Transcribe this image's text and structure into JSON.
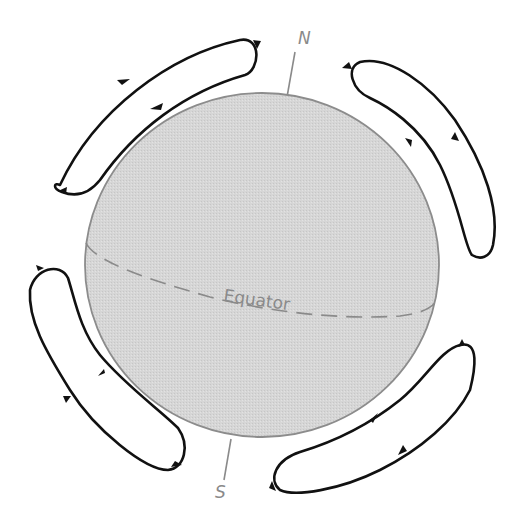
{
  "diagram": {
    "sphere": {
      "fill": "#d4d4d4",
      "outline": "#8c8c8c"
    },
    "axis": {
      "north_label": "N",
      "south_label": "S",
      "color": "#8a8a8a"
    },
    "equator": {
      "label": "Equator",
      "style": "dashed",
      "color": "#8a8a8a"
    },
    "circulation_cells": [
      {
        "id": "upper-left",
        "position": "northwest",
        "flow": "up outer side, down inner side"
      },
      {
        "id": "upper-right",
        "position": "northeast",
        "flow": "down inner side, up outer side"
      },
      {
        "id": "lower-left",
        "position": "southwest",
        "flow": "up inner side, down outer side"
      },
      {
        "id": "lower-right",
        "position": "southeast",
        "flow": "up inner side, down outer side"
      }
    ],
    "loop_color": "#111111"
  }
}
